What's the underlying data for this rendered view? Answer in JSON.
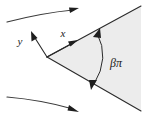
{
  "figure": {
    "kind": "wedge-flow-diagram",
    "width": 142,
    "height": 120,
    "background_color": "#ffffff"
  },
  "wedge": {
    "name": "shaded-wedge-region",
    "fill_color": "#ececec",
    "edge_color": "#2b2b2b",
    "apex": {
      "x": 47,
      "y": 57
    },
    "upper_edge_end": {
      "x": 141,
      "y": 6
    },
    "lower_edge_end": {
      "x": 141,
      "y": 111
    }
  },
  "axes": {
    "x_axis": {
      "label": "x",
      "label_position": {
        "x": 64,
        "y": 36
      },
      "arrow_from": {
        "x": 47,
        "y": 57
      },
      "arrow_to": {
        "x": 76,
        "y": 41
      }
    },
    "y_axis": {
      "label": "y",
      "label_position": {
        "x": 19,
        "y": 44
      },
      "arrow_from": {
        "x": 47,
        "y": 57
      },
      "arrow_to": {
        "x": 33,
        "y": 35
      }
    }
  },
  "angle_annotation": {
    "label": "βπ",
    "label_position": {
      "x": 110,
      "y": 66
    },
    "arc_start": {
      "x": 97,
      "y": 33
    },
    "arc_end": {
      "x": 94,
      "y": 84
    },
    "arc_control": {
      "x": 110,
      "y": 58
    },
    "double_headed": true
  },
  "streamlines": [
    {
      "name": "upper-streamline",
      "start": {
        "x": 7,
        "y": 22
      },
      "control": {
        "x": 42,
        "y": 13
      },
      "end": {
        "x": 77,
        "y": 9
      },
      "arrow_direction": "right-up"
    },
    {
      "name": "lower-streamline",
      "start": {
        "x": 7,
        "y": 97
      },
      "control": {
        "x": 42,
        "y": 101
      },
      "end": {
        "x": 77,
        "y": 111
      },
      "arrow_direction": "right-down"
    }
  ],
  "colors": {
    "line": "#2b2b2b",
    "stream": "#3a3a3a",
    "wedge_fill": "#ececec",
    "text": "#1a1a1a"
  }
}
